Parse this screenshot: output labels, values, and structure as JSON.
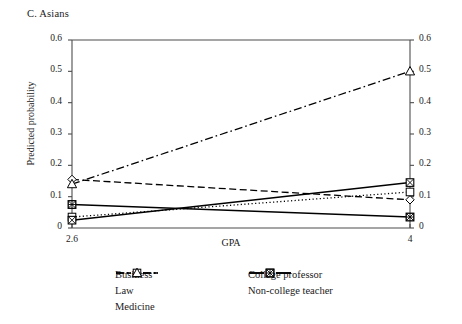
{
  "figure": {
    "panel_title": "C. Asians",
    "xlabel": "GPA",
    "ylabel": "Predicted probability",
    "x_ticks": [
      "2.6",
      "4"
    ],
    "y_ticks_left": [
      "0",
      "0.1",
      "0.2",
      "0.3",
      "0.4",
      "0.5",
      "0.6"
    ],
    "y_ticks_right": [
      "0",
      "0.1",
      "0.2",
      "0.3",
      "0.4",
      "0.5",
      "0.6"
    ]
  },
  "legend": {
    "column_left": [
      {
        "label": "Business",
        "key": "dashed-open-diamond"
      },
      {
        "label": "Law",
        "key": "dotted-open-square"
      },
      {
        "label": "Medicine",
        "key": "dashdot-open-triangle"
      }
    ],
    "column_right": [
      {
        "label": "College professor",
        "key": "solid-crossed-square"
      },
      {
        "label": "Non-college teacher",
        "key": "solid-filled-crossed-square"
      }
    ]
  },
  "colors": {
    "line": "#000000",
    "axis": "#4d4d4d",
    "text": "#1a1a1a",
    "background": "#ffffff"
  },
  "chart_data": {
    "type": "line",
    "title": "C. Asians",
    "xlabel": "GPA",
    "ylabel": "Predicted probability",
    "x": [
      2.6,
      4
    ],
    "xlim": [
      2.6,
      4
    ],
    "ylim": [
      0,
      0.6
    ],
    "ytick_step": 0.1,
    "grid": false,
    "dual_y_axis": true,
    "legend_position": "below-center",
    "series": [
      {
        "name": "Business",
        "values": [
          0.155,
          0.09
        ],
        "marker": "open-diamond",
        "linestyle": "dashed"
      },
      {
        "name": "Law",
        "values": [
          0.035,
          0.115
        ],
        "marker": "open-square",
        "linestyle": "dotted"
      },
      {
        "name": "Medicine",
        "values": [
          0.14,
          0.5
        ],
        "marker": "open-triangle",
        "linestyle": "dash-dot"
      },
      {
        "name": "College professor",
        "values": [
          0.025,
          0.145
        ],
        "marker": "crossed-square",
        "linestyle": "solid"
      },
      {
        "name": "Non-college teacher",
        "values": [
          0.075,
          0.035
        ],
        "marker": "filled-crossed-square",
        "linestyle": "solid"
      }
    ]
  }
}
